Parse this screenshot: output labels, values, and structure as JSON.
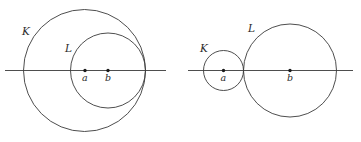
{
  "figure": {
    "background_color": "#ffffff",
    "stroke_color": "#3a3a3a",
    "dot_color": "#1a1a1a",
    "width": 361,
    "height": 142,
    "panels": [
      {
        "id": "left-panel",
        "name": "nested-circles-panel",
        "description": "Circle L lies inside circle K, internally tangent on the right",
        "axis": {
          "name": "horizontal-axis",
          "x1": 5,
          "x2": 166,
          "y": 70.5
        },
        "circles": [
          {
            "name": "circle-K",
            "label": "K",
            "cx": 84.5,
            "cy": 70.5,
            "r": 61,
            "label_x": 22,
            "label_y": 35
          },
          {
            "name": "circle-L",
            "label": "L",
            "cx": 108,
            "cy": 70.5,
            "r": 37.5,
            "label_x": 65,
            "label_y": 52
          }
        ],
        "centers": [
          {
            "name": "center-a",
            "label": "a",
            "cx": 85,
            "cy": 70.5,
            "r": 1.7,
            "label_x": 82,
            "label_y": 81
          },
          {
            "name": "center-b",
            "label": "b",
            "cx": 108,
            "cy": 70.5,
            "r": 1.7,
            "label_x": 105,
            "label_y": 81
          }
        ]
      },
      {
        "id": "right-panel",
        "name": "tangent-circles-panel",
        "description": "Circle K and circle L are externally tangent",
        "axis": {
          "name": "horizontal-axis",
          "x1": 188,
          "x2": 353,
          "y": 70.5
        },
        "circles": [
          {
            "name": "circle-K",
            "label": "K",
            "cx": 223.5,
            "cy": 70.5,
            "r": 20,
            "label_x": 200,
            "label_y": 52
          },
          {
            "name": "circle-L",
            "label": "L",
            "cx": 290,
            "cy": 70.5,
            "r": 46.5,
            "label_x": 248,
            "label_y": 32
          }
        ],
        "centers": [
          {
            "name": "center-a",
            "label": "a",
            "cx": 223.5,
            "cy": 70.5,
            "r": 1.7,
            "label_x": 220.5,
            "label_y": 81
          },
          {
            "name": "center-b",
            "label": "b",
            "cx": 290,
            "cy": 70.5,
            "r": 1.7,
            "label_x": 287,
            "label_y": 81
          }
        ]
      }
    ]
  }
}
